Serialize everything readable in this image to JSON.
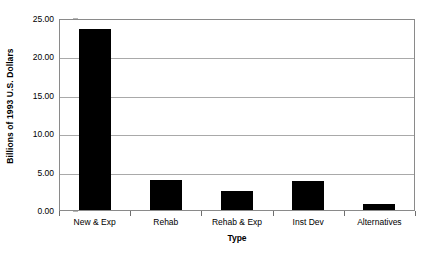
{
  "chart_data": {
    "type": "bar",
    "title": "",
    "subtitle": "",
    "categories": [
      "New & Exp",
      "Rehab",
      "Rehab & Exp",
      "Inst Dev",
      "Alternatives"
    ],
    "values": [
      23.6,
      3.9,
      2.5,
      3.8,
      0.8
    ],
    "xlabel": "Type",
    "ylabel": "Billions of 1993 U.S. Dollars",
    "ylim": [
      0.0,
      25.0
    ],
    "ytick_values": [
      0.0,
      5.0,
      10.0,
      15.0,
      20.0,
      25.0
    ],
    "ytick_labels": [
      "0.00",
      "5.00",
      "10.00",
      "15.00",
      "20.00",
      "25.00"
    ],
    "grid": true,
    "grid_axis": "y",
    "legend": false,
    "legend_position": "none",
    "bar_color": "#000000",
    "plot_background": "#ffffff",
    "gridline_color": "#a9a9a9",
    "axis_color": "#8a8a8a",
    "annotations": []
  }
}
